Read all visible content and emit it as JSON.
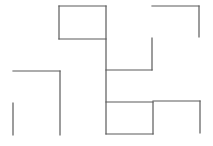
{
  "diagram": {
    "type": "maze-line-drawing",
    "stroke_color": "#5a5a5a",
    "background_color": "#ffffff",
    "segments": [
      {
        "id": "top-rect-top",
        "kind": "horizontal"
      },
      {
        "id": "top-rect-left",
        "kind": "vertical"
      },
      {
        "id": "top-rect-bottom",
        "kind": "horizontal"
      },
      {
        "id": "center-spine",
        "kind": "vertical"
      },
      {
        "id": "top-right-top",
        "kind": "horizontal"
      },
      {
        "id": "top-right-side",
        "kind": "vertical"
      },
      {
        "id": "mid-right-vertical",
        "kind": "vertical"
      },
      {
        "id": "mid-horizontal",
        "kind": "horizontal"
      },
      {
        "id": "left-top",
        "kind": "horizontal"
      },
      {
        "id": "left-inner-vertical",
        "kind": "vertical"
      },
      {
        "id": "left-outer-vertical",
        "kind": "vertical"
      },
      {
        "id": "bottom-rect-top",
        "kind": "horizontal"
      },
      {
        "id": "bottom-rect-right",
        "kind": "vertical"
      },
      {
        "id": "bottom-rect-bottom",
        "kind": "horizontal"
      },
      {
        "id": "bottom-right-top",
        "kind": "horizontal"
      },
      {
        "id": "bottom-right-side",
        "kind": "vertical"
      }
    ]
  }
}
